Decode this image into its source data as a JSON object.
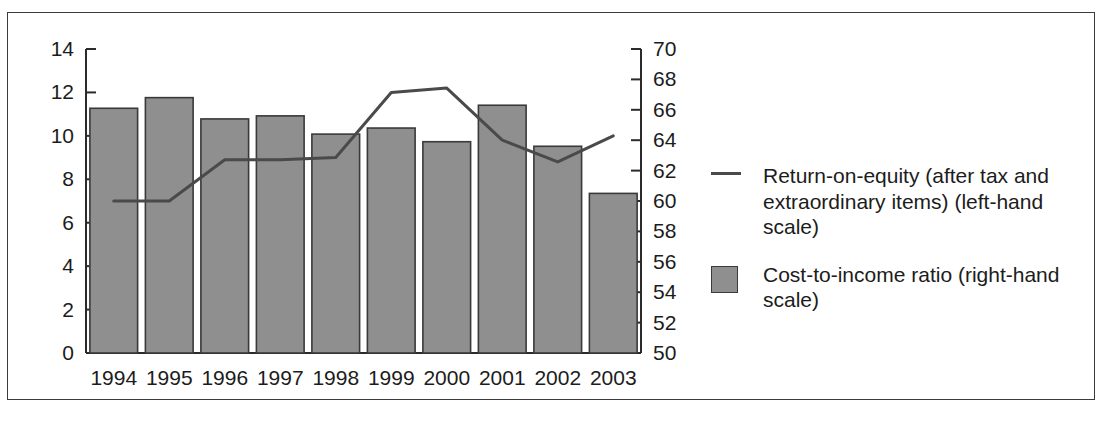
{
  "chart_data": {
    "type": "bar",
    "title": "",
    "subtitle": "",
    "xlabel": "",
    "categories": [
      "1994",
      "1995",
      "1996",
      "1997",
      "1998",
      "1999",
      "2000",
      "2001",
      "2002",
      "2003"
    ],
    "grid": false,
    "legend_position": "right",
    "axes": {
      "left": {
        "label": "",
        "ylim": [
          0,
          14
        ],
        "tick_step": 2,
        "ticks": [
          "0",
          "2",
          "4",
          "6",
          "8",
          "10",
          "12",
          "14"
        ]
      },
      "right": {
        "label": "",
        "ylim": [
          50,
          70
        ],
        "tick_step": 2,
        "ticks": [
          "50",
          "52",
          "54",
          "56",
          "58",
          "60",
          "62",
          "64",
          "66",
          "68",
          "70"
        ]
      }
    },
    "series": [
      {
        "name": "Cost-to-income ratio (right-hand scale)",
        "type": "bar",
        "axis": "right",
        "color": "#8f8f8f",
        "edge_color": "#3a3a3a",
        "values": [
          66.1,
          66.8,
          65.4,
          65.6,
          64.4,
          64.8,
          63.9,
          66.3,
          63.6,
          60.5
        ]
      },
      {
        "name": "Return-on-equity (after tax and extraordinary items) (left-hand scale)",
        "type": "line",
        "axis": "left",
        "color": "#4a4a4a",
        "values": [
          7.0,
          7.0,
          8.9,
          8.9,
          9.0,
          12.0,
          12.2,
          9.8,
          8.8,
          10.0
        ]
      }
    ]
  },
  "legend": {
    "entries": [
      {
        "key": "line",
        "label": "Return-on-equity (after tax and extraordinary items) (left-hand scale)"
      },
      {
        "key": "box",
        "label": "Cost-to-income ratio (right-hand scale)"
      }
    ]
  },
  "colors": {
    "bar_fill": "#8f8f8f",
    "bar_edge": "#3a3a3a",
    "line": "#4a4a4a",
    "axis": "#2b2b2b",
    "frame": "#3b3b3b",
    "text": "#1c1c1c",
    "background": "#ffffff"
  }
}
